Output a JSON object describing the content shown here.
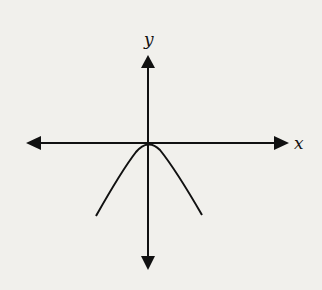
{
  "diagram": {
    "x_label": "x",
    "y_label": "y",
    "curve": "downward-opening parabola with vertex at origin",
    "colors": {
      "background": "#f1f0ec",
      "ink": "#111111"
    }
  }
}
